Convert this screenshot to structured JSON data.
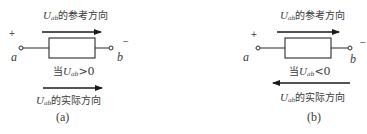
{
  "diagrams": [
    {
      "caption": "(a)",
      "reference_label": {
        "var": "U",
        "sub": "ab",
        "text": "的参考方向"
      },
      "reference_arrow_direction": "right",
      "condition": {
        "prefix": "当",
        "var": "U",
        "sub": "ab",
        "rel": ">0"
      },
      "actual_label": {
        "var": "U",
        "sub": "ab",
        "text": "的实际方向"
      },
      "actual_arrow_direction": "right",
      "terminal_a": "a",
      "terminal_b": "b",
      "plus": "+",
      "minus": "−"
    },
    {
      "caption": "(b)",
      "reference_label": {
        "var": "U",
        "sub": "ab",
        "text": "的参考方向"
      },
      "reference_arrow_direction": "right",
      "condition": {
        "prefix": "当",
        "var": "U",
        "sub": "ab",
        "rel": "<0"
      },
      "actual_label": {
        "var": "U",
        "sub": "ab",
        "text": "的实际方向"
      },
      "actual_arrow_direction": "left",
      "terminal_a": "a",
      "terminal_b": "b",
      "plus": "+",
      "minus": "−"
    }
  ],
  "colors": {
    "line": "#2a2a2a",
    "text": "#3a3a3a",
    "background": "#ffffff"
  }
}
